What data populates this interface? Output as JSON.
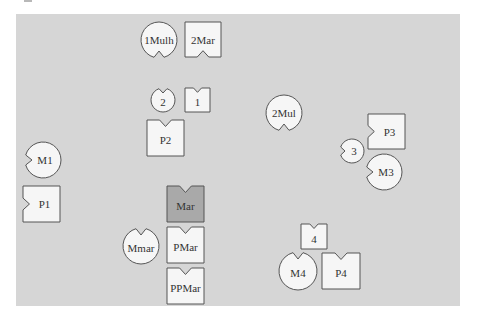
{
  "diagram": {
    "background_color": "#ffffff",
    "panel": {
      "x": 16,
      "y": 14,
      "width": 444,
      "height": 292,
      "color": "#d6d6d6"
    },
    "default_fill": "#f6f6f6",
    "highlight_fill": "#a9a9a9",
    "stroke_color": "#555555",
    "nodes": [
      {
        "id": "1Mulh",
        "label": "1Mulh",
        "shape": "circle",
        "cx": 159,
        "cy": 40,
        "r": 18,
        "notch": "bottom",
        "highlighted": false
      },
      {
        "id": "2Mar",
        "label": "2Mar",
        "shape": "square",
        "x": 185,
        "y": 22,
        "w": 36,
        "h": 35,
        "notch": "bottom",
        "highlighted": false
      },
      {
        "id": "2",
        "label": "2",
        "shape": "circle",
        "cx": 163,
        "cy": 100,
        "r": 12,
        "notch": "top",
        "highlighted": false
      },
      {
        "id": "1",
        "label": "1",
        "shape": "square",
        "x": 185,
        "y": 88,
        "w": 25,
        "h": 24,
        "notch": "top",
        "highlighted": false
      },
      {
        "id": "P2",
        "label": "P2",
        "shape": "square",
        "x": 147,
        "y": 120,
        "w": 37,
        "h": 36,
        "notch": "top",
        "highlighted": false
      },
      {
        "id": "2Mul",
        "label": "2Mul",
        "shape": "circle",
        "cx": 284,
        "cy": 113,
        "r": 18,
        "notch": "bottom",
        "highlighted": false
      },
      {
        "id": "P3",
        "label": "P3",
        "shape": "square",
        "x": 368,
        "y": 114,
        "w": 37,
        "h": 35,
        "notch": "left",
        "highlighted": false
      },
      {
        "id": "3",
        "label": "3",
        "shape": "circle",
        "cx": 352,
        "cy": 151,
        "r": 12,
        "notch": "left",
        "highlighted": false
      },
      {
        "id": "M3",
        "label": "M3",
        "shape": "circle",
        "cx": 384,
        "cy": 172,
        "r": 18,
        "notch": "left",
        "highlighted": false
      },
      {
        "id": "M1",
        "label": "M1",
        "shape": "circle",
        "cx": 43,
        "cy": 160,
        "r": 18,
        "notch": "left",
        "highlighted": false
      },
      {
        "id": "P1",
        "label": "P1",
        "shape": "square",
        "x": 23,
        "y": 186,
        "w": 37,
        "h": 36,
        "notch": "left",
        "highlighted": false
      },
      {
        "id": "Mar",
        "label": "Mar",
        "shape": "square",
        "x": 167,
        "y": 186,
        "w": 37,
        "h": 36,
        "notch": "top",
        "highlighted": true
      },
      {
        "id": "Mmar",
        "label": "Mmar",
        "shape": "circle",
        "cx": 141,
        "cy": 246,
        "r": 18,
        "notch": "top",
        "highlighted": false
      },
      {
        "id": "PMar",
        "label": "PMar",
        "shape": "square",
        "x": 167,
        "y": 227,
        "w": 37,
        "h": 36,
        "notch": "top",
        "highlighted": false
      },
      {
        "id": "PPMar",
        "label": "PPMar",
        "shape": "square",
        "x": 167,
        "y": 268,
        "w": 37,
        "h": 36,
        "notch": "top",
        "highlighted": false
      },
      {
        "id": "4",
        "label": "4",
        "shape": "square",
        "x": 301,
        "y": 224,
        "w": 26,
        "h": 25,
        "notch": "top",
        "highlighted": false
      },
      {
        "id": "M4",
        "label": "M4",
        "shape": "circle",
        "cx": 298,
        "cy": 271,
        "r": 19,
        "notch": "top",
        "highlighted": false
      },
      {
        "id": "P4",
        "label": "P4",
        "shape": "square",
        "x": 322,
        "y": 253,
        "w": 38,
        "h": 36,
        "notch": "top",
        "highlighted": false
      }
    ]
  }
}
